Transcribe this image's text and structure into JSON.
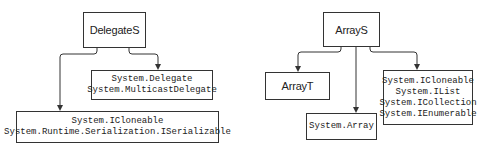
{
  "diagrams": [
    {
      "name": "delegate-diagram",
      "root": {
        "label": "DelegateS"
      },
      "children": [
        {
          "lines": [
            "System.Delegate",
            "System.MulticastDelegate"
          ]
        },
        {
          "lines": [
            "System.ICloneable",
            "System.Runtime.Serialization.ISerializable"
          ]
        }
      ]
    },
    {
      "name": "array-diagram",
      "root": {
        "label": "ArrayS"
      },
      "children": [
        {
          "lines": [
            "ArrayT"
          ]
        },
        {
          "lines": [
            "System.Array"
          ]
        },
        {
          "lines": [
            "System.ICloneable",
            "System.IList",
            "System.ICollection",
            "System.IEnumerable"
          ]
        }
      ]
    }
  ],
  "colors": {
    "stroke": "#333333",
    "text": "#222222",
    "background": "#ffffff"
  }
}
